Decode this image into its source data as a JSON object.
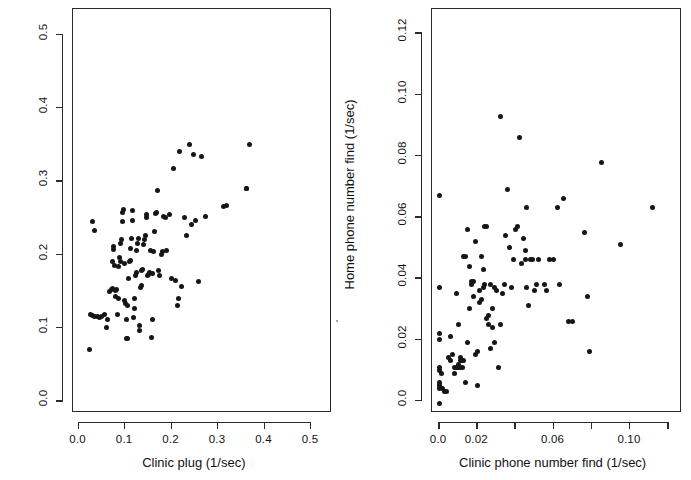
{
  "figure": {
    "background_color": "#ffffff",
    "point_color": "#161616",
    "axis_color": "#2b2b2b"
  },
  "chart_data": [
    {
      "type": "scatter",
      "panel": "left",
      "title": "",
      "xlabel": "Clinic plug (1/sec)",
      "ylabel": "Home plug (1/sec)",
      "xlim": [
        -0.012,
        0.545
      ],
      "ylim": [
        -0.016,
        0.535
      ],
      "xticks": [
        0.0,
        0.1,
        0.2,
        0.3,
        0.4,
        0.5
      ],
      "xticklabels": [
        "0.0",
        "0.1",
        "0.2",
        "0.3",
        "0.4",
        "0.5"
      ],
      "yticks": [
        0.0,
        0.1,
        0.2,
        0.3,
        0.4,
        0.5
      ],
      "yticklabels": [
        "0.0",
        "0.1",
        "0.2",
        "0.3",
        "0.4",
        "0.5"
      ],
      "grid": false,
      "legend": "none",
      "n_points": 104,
      "x": [
        0.03,
        0.035,
        0.023,
        0.026,
        0.03,
        0.034,
        0.04,
        0.044,
        0.05,
        0.055,
        0.059,
        0.063,
        0.067,
        0.07,
        0.072,
        0.074,
        0.075,
        0.076,
        0.078,
        0.079,
        0.08,
        0.082,
        0.083,
        0.085,
        0.086,
        0.088,
        0.09,
        0.091,
        0.092,
        0.094,
        0.095,
        0.096,
        0.098,
        0.099,
        0.1,
        0.102,
        0.104,
        0.105,
        0.106,
        0.108,
        0.11,
        0.111,
        0.112,
        0.114,
        0.115,
        0.116,
        0.118,
        0.12,
        0.121,
        0.122,
        0.124,
        0.125,
        0.126,
        0.128,
        0.13,
        0.131,
        0.133,
        0.135,
        0.136,
        0.138,
        0.14,
        0.142,
        0.143,
        0.145,
        0.147,
        0.148,
        0.15,
        0.152,
        0.154,
        0.156,
        0.158,
        0.16,
        0.162,
        0.164,
        0.166,
        0.168,
        0.17,
        0.172,
        0.175,
        0.178,
        0.18,
        0.182,
        0.186,
        0.19,
        0.195,
        0.2,
        0.205,
        0.208,
        0.212,
        0.215,
        0.218,
        0.222,
        0.228,
        0.232,
        0.238,
        0.242,
        0.248,
        0.252,
        0.258,
        0.265,
        0.272,
        0.312,
        0.318,
        0.362
      ],
      "y": [
        0.245,
        0.233,
        0.07,
        0.118,
        0.117,
        0.116,
        0.115,
        0.114,
        0.116,
        0.118,
        0.1,
        0.112,
        0.15,
        0.152,
        0.154,
        0.19,
        0.207,
        0.211,
        0.185,
        0.143,
        0.151,
        0.153,
        0.118,
        0.14,
        0.184,
        0.196,
        0.19,
        0.215,
        0.22,
        0.245,
        0.258,
        0.262,
        0.188,
        0.137,
        0.133,
        0.112,
        0.086,
        0.086,
        0.13,
        0.168,
        0.19,
        0.192,
        0.208,
        0.222,
        0.26,
        0.247,
        0.114,
        0.126,
        0.14,
        0.172,
        0.176,
        0.205,
        0.215,
        0.222,
        0.103,
        0.097,
        0.155,
        0.158,
        0.178,
        0.18,
        0.214,
        0.22,
        0.226,
        0.25,
        0.255,
        0.172,
        0.173,
        0.176,
        0.205,
        0.087,
        0.112,
        0.174,
        0.204,
        0.232,
        0.256,
        0.258,
        0.288,
        0.178,
        0.172,
        0.2,
        0.204,
        0.252,
        0.25,
        0.206,
        0.255,
        0.168,
        0.317,
        0.165,
        0.13,
        0.14,
        0.34,
        0.157,
        0.251,
        0.226,
        0.35,
        0.241,
        0.336,
        0.247,
        0.164,
        0.334,
        0.252,
        0.266,
        0.267,
        0.29
      ],
      "extra_points": [
        {
          "x": 0.368,
          "y": 0.35
        },
        {
          "x": 0.362,
          "y": 0.29
        }
      ]
    },
    {
      "type": "scatter",
      "panel": "right",
      "title": "",
      "xlabel": "Clinic phone number find (1/sec)",
      "ylabel": "Home phone number find (1/sec)",
      "xlim": [
        -0.004,
        0.127
      ],
      "ylim": [
        -0.004,
        0.128
      ],
      "xticks": [
        0.0,
        0.02,
        0.04,
        0.06,
        0.08,
        0.1,
        0.12
      ],
      "xticklabels": [
        "0.0",
        "0.02",
        "",
        "0.06",
        "",
        "0.10",
        ""
      ],
      "yticks": [
        0.0,
        0.02,
        0.04,
        0.06,
        0.08,
        0.1,
        0.12
      ],
      "yticklabels": [
        "0.0",
        "0.02",
        "0.04",
        "0.06",
        "0.08",
        "0.10",
        "0.12"
      ],
      "grid": false,
      "legend": "none",
      "n_points": 106,
      "x": [
        0.0,
        0.0,
        0.0,
        0.0,
        0.0,
        0.0,
        0.0,
        0.0,
        0.0,
        0.0,
        0.0,
        0.001,
        0.002,
        0.003,
        0.004,
        0.005,
        0.006,
        0.006,
        0.007,
        0.008,
        0.008,
        0.009,
        0.009,
        0.01,
        0.01,
        0.01,
        0.011,
        0.011,
        0.011,
        0.012,
        0.012,
        0.013,
        0.013,
        0.014,
        0.014,
        0.015,
        0.015,
        0.016,
        0.016,
        0.017,
        0.017,
        0.018,
        0.018,
        0.019,
        0.019,
        0.02,
        0.02,
        0.021,
        0.021,
        0.022,
        0.022,
        0.023,
        0.023,
        0.024,
        0.024,
        0.025,
        0.025,
        0.026,
        0.026,
        0.027,
        0.027,
        0.028,
        0.028,
        0.029,
        0.029,
        0.03,
        0.031,
        0.032,
        0.032,
        0.033,
        0.034,
        0.035,
        0.036,
        0.037,
        0.038,
        0.039,
        0.04,
        0.041,
        0.042,
        0.043,
        0.044,
        0.045,
        0.046,
        0.046,
        0.047,
        0.048,
        0.049,
        0.05,
        0.051,
        0.052,
        0.055,
        0.056,
        0.058,
        0.06,
        0.062,
        0.063,
        0.065,
        0.068,
        0.07,
        0.076,
        0.078,
        0.079,
        0.085,
        0.095,
        0.112,
        0.045
      ],
      "y": [
        0.067,
        0.037,
        0.022,
        0.02,
        0.011,
        0.01,
        0.006,
        0.005,
        0.005,
        0.004,
        -0.001,
        0.009,
        0.004,
        0.003,
        0.003,
        0.014,
        0.013,
        0.021,
        0.015,
        0.009,
        0.011,
        0.011,
        0.035,
        0.011,
        0.012,
        0.025,
        0.011,
        0.013,
        0.014,
        0.013,
        0.011,
        0.013,
        0.047,
        0.047,
        0.006,
        0.056,
        0.019,
        0.03,
        0.044,
        0.038,
        0.039,
        0.039,
        0.034,
        0.052,
        0.015,
        0.016,
        0.005,
        0.032,
        0.036,
        0.033,
        0.047,
        0.043,
        0.037,
        0.038,
        0.057,
        0.057,
        0.027,
        0.025,
        0.028,
        0.038,
        0.017,
        0.03,
        0.024,
        0.037,
        0.019,
        0.036,
        0.011,
        0.025,
        0.093,
        0.035,
        0.038,
        0.054,
        0.069,
        0.05,
        0.037,
        0.046,
        0.056,
        0.057,
        0.086,
        0.045,
        0.053,
        0.046,
        0.037,
        0.063,
        0.031,
        0.046,
        0.046,
        0.036,
        0.038,
        0.046,
        0.038,
        0.036,
        0.046,
        0.046,
        0.063,
        0.038,
        0.066,
        0.026,
        0.026,
        0.055,
        0.034,
        0.016,
        0.078,
        0.051,
        0.063,
        0.049
      ]
    }
  ],
  "panels": {
    "left": {
      "xlabel": "Clinic plug (1/sec)",
      "ylabel": "Home plug (1/sec)",
      "xticklabels": [
        "0.0",
        "0.1",
        "0.2",
        "0.3",
        "0.4",
        "0.5"
      ],
      "yticklabels": [
        "0.0",
        "0.1",
        "0.2",
        "0.3",
        "0.4",
        "0.5"
      ]
    },
    "right": {
      "xlabel": "Clinic phone number find (1/sec)",
      "ylabel": "Home phone number find (1/sec)",
      "xticklabels": [
        "0.0",
        "0.02",
        "0.06",
        "0.10"
      ],
      "yticklabels": [
        "0.0",
        "0.02",
        "0.04",
        "0.06",
        "0.08",
        "0.10",
        "0.12"
      ]
    }
  }
}
